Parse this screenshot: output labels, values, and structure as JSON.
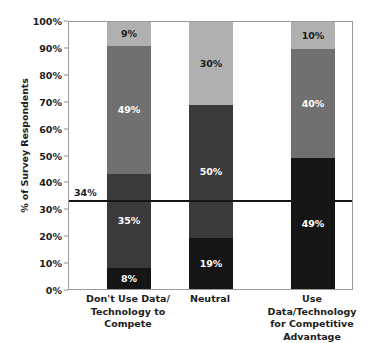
{
  "chart_data": {
    "type": "bar",
    "stacked": true,
    "title": "",
    "xlabel": "",
    "ylabel": "% of Survey Respondents",
    "ylim": [
      0,
      100
    ],
    "ytick_labels": [
      "0%",
      "10%",
      "20%",
      "30%",
      "40%",
      "50%",
      "60%",
      "70%",
      "80%",
      "90%",
      "100%"
    ],
    "ytick_values": [
      0,
      10,
      20,
      30,
      40,
      50,
      60,
      70,
      80,
      90,
      100
    ],
    "grid": false,
    "legend": "none",
    "categories": [
      "Don't Use Data/\nTechnology to\nCompete",
      "Neutral",
      "Use Data/Technology\nfor Competitive\nAdvantage"
    ],
    "series": [
      {
        "name": "segment-1-bottom",
        "color": "#151515",
        "values": [
          8,
          19,
          49
        ],
        "labels": [
          "8%",
          "19%",
          "49%"
        ]
      },
      {
        "name": "segment-2",
        "color": "#3a3a3a",
        "values": [
          35,
          50,
          0
        ],
        "labels": [
          "35%",
          "50%",
          ""
        ]
      },
      {
        "name": "segment-3",
        "color": "#707070",
        "values": [
          48,
          0,
          41
        ],
        "labels": [
          "49%",
          "",
          "40%"
        ]
      },
      {
        "name": "segment-4-top",
        "color": "#b0b0b0",
        "values": [
          9,
          31,
          10
        ],
        "labels": [
          "9%",
          "30%",
          "10%"
        ]
      }
    ],
    "reference_line": {
      "value": 34,
      "label": "34%",
      "color": "#161616"
    }
  }
}
